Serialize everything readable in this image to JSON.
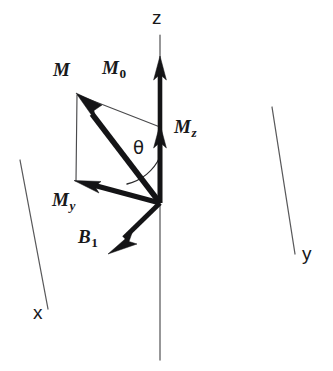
{
  "figure": {
    "kind": "vector-diagram",
    "background_color": "#ffffff",
    "ink_color": "#141416",
    "axis_color": "#59595b",
    "width": 333,
    "height": 371
  },
  "axes": [
    {
      "id": "z",
      "label": "z",
      "label_x": 158,
      "label_y": 10,
      "line": {
        "x1": 160,
        "y1": 35,
        "x2": 160,
        "y2": 360
      }
    },
    {
      "id": "y",
      "label": "y",
      "label_x": 303,
      "label_y": 247,
      "line": {
        "x1": 272,
        "y1": 107,
        "x2": 295,
        "y2": 254
      }
    },
    {
      "id": "x",
      "label": "x",
      "label_x": 34,
      "label_y": 306,
      "line": {
        "x1": 20,
        "y1": 160,
        "x2": 48,
        "y2": 309
      }
    }
  ],
  "origin": {
    "x": 160,
    "y": 203
  },
  "vectors": [
    {
      "id": "M0",
      "label": "M",
      "subscript": "0",
      "subscript_style": "roman",
      "label_x": 104,
      "label_y": 60,
      "tip": {
        "x": 160,
        "y": 58
      },
      "tail": {
        "x": 160,
        "y": 203
      },
      "shaft_width": 4.6,
      "description": "equilibrium magnetization along +z"
    },
    {
      "id": "Mz",
      "label": "M",
      "subscript": "z",
      "subscript_style": "italic",
      "label_x": 175,
      "label_y": 119,
      "tip": {
        "x": 160,
        "y": 126
      },
      "tail": {
        "x": 160,
        "y": 203
      },
      "shaft_width": 4.6,
      "description": "longitudinal component of M along z"
    },
    {
      "id": "M",
      "label": "M",
      "subscript": "",
      "subscript_style": "none",
      "label_x": 54,
      "label_y": 62,
      "tip": {
        "x": 77,
        "y": 94
      },
      "tail": {
        "x": 160,
        "y": 203
      },
      "shaft_width": 5.4,
      "description": "net magnetization vector tipped by angle theta"
    },
    {
      "id": "My",
      "label": "M",
      "subscript": "y",
      "subscript_style": "italic",
      "label_x": 54,
      "label_y": 192,
      "tip": {
        "x": 75,
        "y": 181
      },
      "tail": {
        "x": 160,
        "y": 203
      },
      "shaft_width": 5.0,
      "description": "transverse component of M along -y"
    },
    {
      "id": "B1",
      "label": "B",
      "subscript": "1",
      "subscript_style": "roman",
      "label_x": 79,
      "label_y": 229,
      "tip": {
        "x": 110,
        "y": 252
      },
      "tail": {
        "x": 160,
        "y": 203
      },
      "shaft_width": 4.6,
      "description": "radiofrequency field B1 along -x"
    }
  ],
  "projections": [
    {
      "id": "M-to-Mz",
      "from": {
        "x": 77,
        "y": 94
      },
      "to": {
        "x": 160,
        "y": 126
      },
      "description": "thin construction line from M tip to Mz tip"
    },
    {
      "id": "M-to-My",
      "from": {
        "x": 77,
        "y": 94
      },
      "to": {
        "x": 76,
        "y": 181
      },
      "description": "thin construction line from M tip down to My tip"
    }
  ],
  "angle": {
    "id": "theta",
    "symbol": "θ",
    "label_x": 134,
    "label_y": 140,
    "between": [
      "M",
      "z-axis"
    ],
    "arc_path": "M 160 155 A 48 48 0 0 1 129 182",
    "description": "flip angle between the net magnetization M and the z axis"
  }
}
